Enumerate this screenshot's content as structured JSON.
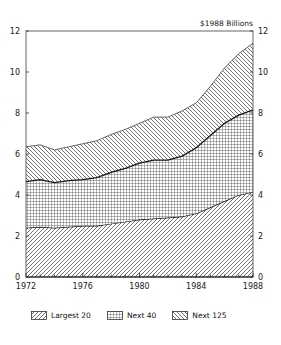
{
  "chart_data": {
    "type": "area",
    "stacked": true,
    "title": "",
    "unit_label": "$1988 Billions",
    "xlabel": "",
    "ylabel": "$1988 Billions",
    "x": [
      1972,
      1973,
      1974,
      1975,
      1976,
      1977,
      1978,
      1979,
      1980,
      1981,
      1982,
      1983,
      1984,
      1985,
      1986,
      1987,
      1988
    ],
    "series": [
      {
        "name": "Largest 20",
        "pattern": "diagonal-forward",
        "values": [
          2.4,
          2.45,
          2.4,
          2.45,
          2.5,
          2.5,
          2.6,
          2.7,
          2.8,
          2.85,
          2.9,
          2.95,
          3.1,
          3.4,
          3.7,
          4.0,
          4.15
        ]
      },
      {
        "name": "Next 40",
        "pattern": "crosshatch-grid",
        "values": [
          2.25,
          2.3,
          2.2,
          2.25,
          2.25,
          2.35,
          2.5,
          2.6,
          2.75,
          2.85,
          2.8,
          2.95,
          3.2,
          3.5,
          3.8,
          3.9,
          4.0
        ]
      },
      {
        "name": "Next 125",
        "pattern": "diagonal-backward",
        "values": [
          1.7,
          1.7,
          1.6,
          1.65,
          1.75,
          1.8,
          1.85,
          1.9,
          1.95,
          2.1,
          2.1,
          2.2,
          2.2,
          2.4,
          2.7,
          3.0,
          3.25
        ]
      }
    ],
    "cumulative_tops": {
      "Largest 20": [
        2.4,
        2.45,
        2.4,
        2.45,
        2.5,
        2.5,
        2.6,
        2.7,
        2.8,
        2.85,
        2.9,
        2.95,
        3.1,
        3.4,
        3.7,
        4.0,
        4.15
      ],
      "Next 40": [
        4.65,
        4.75,
        4.6,
        4.7,
        4.75,
        4.85,
        5.1,
        5.3,
        5.55,
        5.7,
        5.7,
        5.9,
        6.3,
        6.9,
        7.5,
        7.9,
        8.15
      ],
      "Next 125": [
        6.35,
        6.45,
        6.2,
        6.35,
        6.5,
        6.65,
        6.95,
        7.2,
        7.5,
        7.8,
        7.8,
        8.1,
        8.5,
        9.3,
        10.2,
        10.9,
        11.4
      ]
    },
    "xlim": [
      1972,
      1988
    ],
    "ylim": [
      0,
      12
    ],
    "x_ticks": [
      "1972",
      "1976",
      "1980",
      "1984",
      "1988"
    ],
    "y_ticks": [
      "0",
      "2",
      "4",
      "6",
      "8",
      "10",
      "12"
    ],
    "y_ticks_right": [
      "0",
      "2",
      "4",
      "6",
      "8",
      "10",
      "12"
    ],
    "grid": false,
    "legend_position": "bottom",
    "legend": [
      "Largest 20",
      "Next 40",
      "Next 125"
    ]
  }
}
